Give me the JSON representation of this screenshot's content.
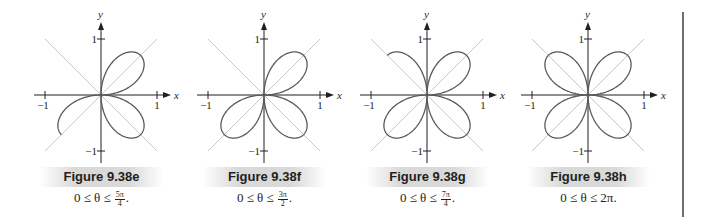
{
  "figures": [
    {
      "id": "e",
      "label": "Figure 9.38e",
      "range_prefix": "0 ≤ θ ≤",
      "range_num": "5π",
      "range_den": "4",
      "range_suffix": ".",
      "range_plain": "",
      "theta_max": 3.9269908
    },
    {
      "id": "f",
      "label": "Figure 9.38f",
      "range_prefix": "0 ≤ θ ≤",
      "range_num": "3π",
      "range_den": "2",
      "range_suffix": ".",
      "range_plain": "",
      "theta_max": 4.712389
    },
    {
      "id": "g",
      "label": "Figure 9.38g",
      "range_prefix": "0 ≤ θ ≤",
      "range_num": "7π",
      "range_den": "4",
      "range_suffix": ".",
      "range_plain": "",
      "theta_max": 5.4977871
    },
    {
      "id": "h",
      "label": "Figure 9.38h",
      "range_prefix": "",
      "range_num": "",
      "range_den": "",
      "range_suffix": "",
      "range_plain": "0 ≤ θ ≤ 2π.",
      "theta_max": 6.2831853
    }
  ],
  "axes": {
    "x_label": "x",
    "y_label": "y",
    "tick_pos": "1",
    "tick_neg": "−1"
  },
  "curve": {
    "equation": "r = sin(2θ)",
    "color": "#58595b",
    "guide_color": "#c8c8c8",
    "axis_color": "#231f20"
  }
}
